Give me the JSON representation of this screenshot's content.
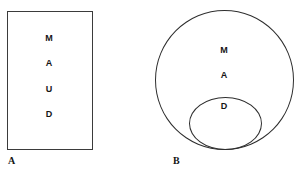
{
  "figure": {
    "panels": [
      {
        "caption": "A",
        "shape": "rectangle",
        "labels": [
          "M",
          "A",
          "U",
          "D"
        ]
      },
      {
        "caption": "B",
        "shape": "nested-circles",
        "outer_labels": [
          "M",
          "A"
        ],
        "inner_labels": [
          "D"
        ]
      }
    ],
    "colors": {
      "stroke": "#2e2e2e",
      "rect_stroke": "#3b3b3b",
      "text": "#151515",
      "background": "#ffffff"
    }
  }
}
